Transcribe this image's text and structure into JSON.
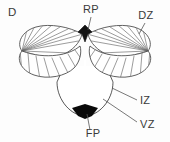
{
  "figure": {
    "panel_label": "D",
    "background_color": "#fdfdfd",
    "outline_color": "#444444",
    "hatch_color": "#666666",
    "label_color": "#3a3a3a",
    "leader_color": "#555555"
  },
  "labels": [
    {
      "id": "panel",
      "text": "D",
      "x": 8,
      "y": 16,
      "anchor": "start",
      "has_leader": false
    },
    {
      "id": "rp",
      "text": "RP",
      "x": 91,
      "y": 13,
      "anchor": "middle",
      "has_leader": true
    },
    {
      "id": "dz",
      "text": "DZ",
      "x": 146,
      "y": 19,
      "anchor": "middle",
      "has_leader": true
    },
    {
      "id": "iz",
      "text": "IZ",
      "x": 140,
      "y": 103,
      "anchor": "start",
      "has_leader": true
    },
    {
      "id": "vz",
      "text": "VZ",
      "x": 140,
      "y": 127,
      "anchor": "start",
      "has_leader": true
    },
    {
      "id": "fp",
      "text": "FP",
      "x": 93,
      "y": 136,
      "anchor": "middle",
      "has_leader": true
    }
  ],
  "leaders": [
    {
      "id": "rp-leader",
      "from": [
        91,
        17
      ],
      "to": [
        91,
        31
      ]
    },
    {
      "id": "dz-leader",
      "from": [
        145,
        23
      ],
      "to": [
        138,
        33
      ]
    },
    {
      "id": "iz-leader",
      "from": [
        138,
        99
      ],
      "to": [
        113,
        88
      ]
    },
    {
      "id": "vz-leader",
      "from": [
        138,
        122
      ],
      "to": [
        105,
        99
      ]
    },
    {
      "id": "fp-leader",
      "from": [
        93,
        131
      ],
      "to": [
        93,
        113
      ]
    }
  ],
  "structures": {
    "roof_plate": {
      "name": "RP",
      "fill": "#111111",
      "note": "black wedge at dorsal midline"
    },
    "dorsal_zone": {
      "name": "DZ",
      "fill": "#ffffff",
      "note": "hatched wings"
    },
    "intermediate_zone": {
      "name": "IZ",
      "note": "mid gray stacked bands"
    },
    "ventricular_zone": {
      "name": "VZ",
      "note": "dark gray to black bands near lumen"
    },
    "floor_plate": {
      "name": "FP",
      "fill": "#0a0a0a",
      "note": "black wedge at ventral midline"
    }
  },
  "bands": [
    {
      "index": 0,
      "color": "#d8d8d8"
    },
    {
      "index": 1,
      "color": "#ffffff"
    },
    {
      "index": 2,
      "color": "#2a2a2a"
    },
    {
      "index": 3,
      "color": "#b5b5b5"
    },
    {
      "index": 4,
      "color": "#ffffff"
    },
    {
      "index": 5,
      "color": "#3a3a3a"
    },
    {
      "index": 6,
      "color": "#8f8f8f"
    },
    {
      "index": 7,
      "color": "#e4e4e4"
    },
    {
      "index": 8,
      "color": "#4a4a4a"
    },
    {
      "index": 9,
      "color": "#9b9b9b"
    },
    {
      "index": 10,
      "color": "#222222"
    },
    {
      "index": 11,
      "color": "#6e6e6e"
    },
    {
      "index": 12,
      "color": "#303030"
    },
    {
      "index": 13,
      "color": "#141414"
    },
    {
      "index": 14,
      "color": "#0a0a0a"
    }
  ]
}
